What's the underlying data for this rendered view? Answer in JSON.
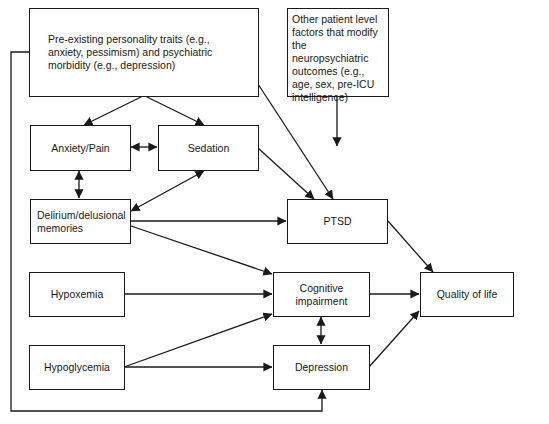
{
  "diagram": {
    "type": "flowchart",
    "nodes": [
      {
        "id": "preexisting",
        "label": "Pre-existing personality traits (e.g., anxiety, pessimism) and psychiatric morbidity (e.g., depression)"
      },
      {
        "id": "other",
        "label": "Other patient level factors that modify the neuropsychiatric outcomes (e.g., age, sex, pre-ICU intelligence)"
      },
      {
        "id": "anxiety",
        "label": "Anxiety/Pain"
      },
      {
        "id": "sedation",
        "label": "Sedation"
      },
      {
        "id": "delirium",
        "label": "Delirium/delusional memories"
      },
      {
        "id": "ptsd",
        "label": "PTSD"
      },
      {
        "id": "hypoxemia",
        "label": "Hypoxemia"
      },
      {
        "id": "cognitive",
        "label": "Cognitive impairment"
      },
      {
        "id": "quality",
        "label": "Quality of life"
      },
      {
        "id": "hypoglycemia",
        "label": "Hypoglycemia"
      },
      {
        "id": "depression",
        "label": "Depression"
      }
    ],
    "edges": [
      {
        "from": "preexisting",
        "to": "anxiety",
        "type": "directed"
      },
      {
        "from": "preexisting",
        "to": "sedation",
        "type": "directed"
      },
      {
        "from": "preexisting",
        "to": "ptsd",
        "type": "directed"
      },
      {
        "from": "preexisting",
        "to": "depression",
        "type": "directed"
      },
      {
        "from": "other",
        "to": "ptsd",
        "type": "directed"
      },
      {
        "from": "anxiety",
        "to": "sedation",
        "type": "bidirectional"
      },
      {
        "from": "anxiety",
        "to": "delirium",
        "type": "bidirectional"
      },
      {
        "from": "sedation",
        "to": "delirium",
        "type": "bidirectional"
      },
      {
        "from": "sedation",
        "to": "ptsd",
        "type": "directed"
      },
      {
        "from": "delirium",
        "to": "ptsd",
        "type": "directed"
      },
      {
        "from": "delirium",
        "to": "cognitive",
        "type": "directed"
      },
      {
        "from": "hypoxemia",
        "to": "cognitive",
        "type": "directed"
      },
      {
        "from": "hypoglycemia",
        "to": "cognitive",
        "type": "directed"
      },
      {
        "from": "hypoglycemia",
        "to": "depression",
        "type": "directed"
      },
      {
        "from": "cognitive",
        "to": "depression",
        "type": "bidirectional"
      },
      {
        "from": "ptsd",
        "to": "quality",
        "type": "directed"
      },
      {
        "from": "cognitive",
        "to": "quality",
        "type": "directed"
      },
      {
        "from": "depression",
        "to": "quality",
        "type": "directed"
      }
    ]
  }
}
